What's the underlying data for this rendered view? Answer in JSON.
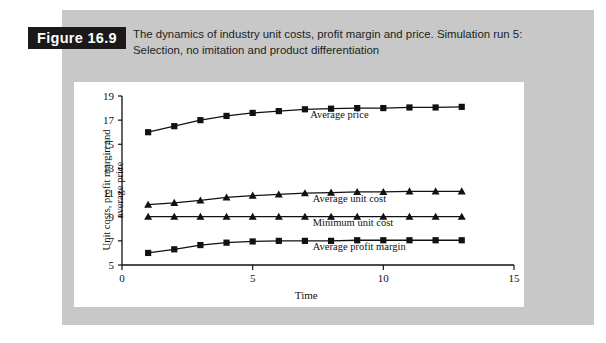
{
  "figure": {
    "badge": "Figure 16.9",
    "caption_line1": "The dynamics of industry unit costs, profit margin and price. Simulation run 5:",
    "caption_line2": "Selection, no imitation and product differentiation"
  },
  "colors": {
    "page_background": "#ffffff",
    "panel_background": "#c8c8c8",
    "card_background": "#ffffff",
    "badge_background": "#1a1a1a",
    "badge_text": "#ffffff",
    "ink": "#111111"
  },
  "chart_data": {
    "type": "line",
    "title": "",
    "xlabel": "Time",
    "ylabel": "Unit costs, profit margin and average price",
    "ylabel_line1": "Unit costs, profit margin and",
    "ylabel_line2": "average price",
    "xlim": [
      0,
      15
    ],
    "ylim": [
      5,
      19
    ],
    "xticks": [
      0,
      5,
      10,
      15
    ],
    "yticks": [
      5,
      7,
      9,
      11,
      13,
      15,
      17,
      19
    ],
    "xticklabels": [
      "0",
      "5",
      "10",
      "15"
    ],
    "yticklabels": [
      "5",
      "7",
      "9",
      "11",
      "13",
      "15",
      "17",
      "19"
    ],
    "grid": false,
    "legend": "inline-labels",
    "x": [
      1,
      2,
      3,
      4,
      5,
      6,
      7,
      8,
      9,
      10,
      11,
      12,
      13
    ],
    "series": [
      {
        "name": "Average price",
        "marker": "square",
        "label_x": 7.2,
        "label_y": 17.2,
        "values": [
          16.0,
          16.5,
          17.0,
          17.35,
          17.6,
          17.75,
          17.9,
          17.95,
          18.0,
          18.0,
          18.05,
          18.05,
          18.1
        ]
      },
      {
        "name": "Average unit cost",
        "marker": "triangle",
        "label_x": 7.3,
        "label_y": 10.2,
        "values": [
          10.0,
          10.15,
          10.35,
          10.6,
          10.75,
          10.85,
          10.95,
          11.0,
          11.05,
          11.05,
          11.1,
          11.1,
          11.1
        ]
      },
      {
        "name": "Minimum unit cost",
        "marker": "triangle",
        "label_x": 7.3,
        "label_y": 8.25,
        "values": [
          9.0,
          9.0,
          9.0,
          9.0,
          9.0,
          9.0,
          9.0,
          9.0,
          9.0,
          9.0,
          9.0,
          9.0,
          9.0
        ]
      },
      {
        "name": "Average profit margin",
        "marker": "square",
        "label_x": 7.3,
        "label_y": 6.25,
        "values": [
          6.0,
          6.3,
          6.65,
          6.85,
          6.95,
          7.0,
          7.0,
          7.0,
          7.05,
          7.05,
          7.05,
          7.05,
          7.05
        ]
      }
    ]
  }
}
